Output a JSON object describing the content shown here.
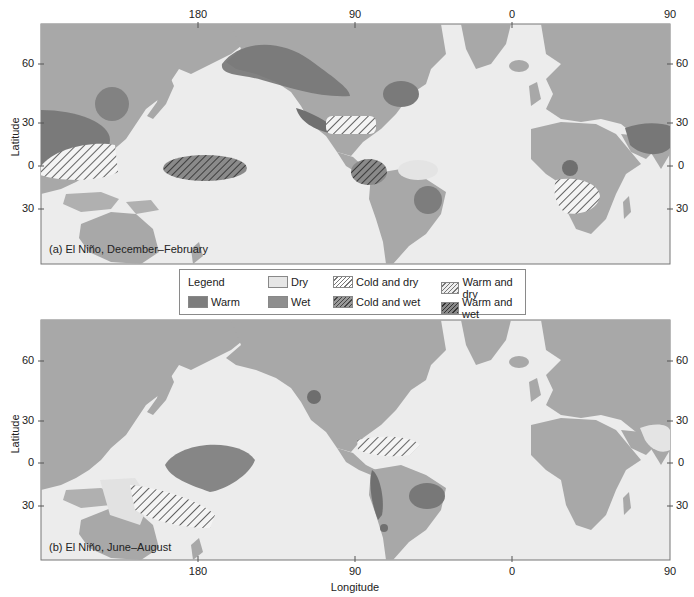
{
  "figure": {
    "panels": [
      {
        "id": "a",
        "caption": "(a) El Niño, December–February",
        "regions": [
          {
            "name": "Alaska / NW Canada",
            "type": "Warm"
          },
          {
            "name": "Japan / Korea",
            "type": "Wet"
          },
          {
            "name": "Southern China",
            "type": "Warm"
          },
          {
            "name": "Philippines / Indonesia / N Australia",
            "type": "Warm and dry"
          },
          {
            "name": "Central Pacific",
            "type": "Warm and wet"
          },
          {
            "name": "Southern USA (Gulf coast)",
            "type": "Cold and wet"
          },
          {
            "name": "SE Canada / NE USA",
            "type": "Wet"
          },
          {
            "name": "Ecuador / Peru",
            "type": "Warm and wet"
          },
          {
            "name": "Northern Brazil",
            "type": "Dry"
          },
          {
            "name": "SE South America",
            "type": "Wet"
          },
          {
            "name": "East Africa",
            "type": "Wet"
          },
          {
            "name": "Southern Africa",
            "type": "Warm and dry"
          },
          {
            "name": "India / SE Asia",
            "type": "Warm"
          }
        ]
      },
      {
        "id": "b",
        "caption": "(b) El Niño, June–August",
        "regions": [
          {
            "name": "Western USA (Great Basin)",
            "type": "Wet"
          },
          {
            "name": "Central Pacific",
            "type": "Wet"
          },
          {
            "name": "Eastern Australia",
            "type": "Cold and dry"
          },
          {
            "name": "Central America / Caribbean",
            "type": "Warm and dry"
          },
          {
            "name": "Chile / Andes",
            "type": "Wet"
          },
          {
            "name": "SE South America",
            "type": "Wet"
          },
          {
            "name": "Southern Chile",
            "type": "Wet"
          },
          {
            "name": "India",
            "type": "Dry"
          },
          {
            "name": "Eastern Australia (dry)",
            "type": "Dry"
          }
        ]
      }
    ],
    "axes": {
      "top_ticks": [
        "180",
        "90",
        "0",
        "90"
      ],
      "bottom_ticks": [
        "180",
        "90",
        "0",
        "90"
      ],
      "left_ticks": [
        "60",
        "30",
        "0",
        "30"
      ],
      "right_ticks": [
        "60",
        "30",
        "0",
        "30"
      ],
      "ylabel": "Latitude",
      "xlabel": "Longitude"
    },
    "legend": {
      "title": "Legend",
      "items": [
        {
          "label": "Dry",
          "style": "dry"
        },
        {
          "label": "Cold and dry",
          "style": "cold-dry"
        },
        {
          "label": "Warm and dry",
          "style": "warm-dry"
        },
        {
          "label": "Warm",
          "style": "warm"
        },
        {
          "label": "Wet",
          "style": "wet"
        },
        {
          "label": "Cold and wet",
          "style": "cold-wet"
        },
        {
          "label": "Warm and wet",
          "style": "warm-wet"
        }
      ]
    },
    "colors": {
      "ocean": "#ececec",
      "land": "#a9a9a9",
      "warm": "#767676",
      "wet": "#888888",
      "dry": "#e4e4e4",
      "hatch_line": "#3c3c3c",
      "frame": "#777777"
    }
  }
}
